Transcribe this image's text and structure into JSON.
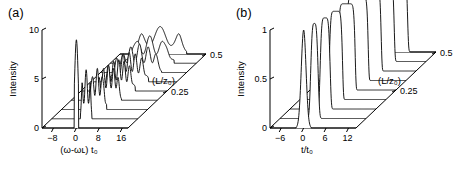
{
  "figure": {
    "background": "#ffffff",
    "line_color": "#000000",
    "panels": [
      {
        "id": "a",
        "label": "(a)",
        "y_axis_label": "Intensity",
        "y_ticks": [
          "0",
          "5",
          "10"
        ],
        "x_axis_label": "(ω-ωʟ) t₀",
        "x_ticks": [
          "−8",
          "0",
          "8",
          "16"
        ],
        "z_axis_label": "(L/z₀)",
        "z_ticks": [
          "0.25",
          "0.5"
        ]
      },
      {
        "id": "b",
        "label": "(b)",
        "y_axis_label": "Intensity",
        "y_ticks": [
          "0",
          "0.5",
          "1"
        ],
        "x_axis_label": "t/t₀",
        "x_ticks": [
          "−6",
          "0",
          "6",
          "12"
        ],
        "z_axis_label": "(L/z₀)",
        "z_ticks": [
          "0.25",
          "0.5"
        ]
      }
    ]
  },
  "chart_data": [
    {
      "type": "line",
      "title": "(a)",
      "plot_style": "waterfall-3d",
      "xlabel": "(ω-ωʟ) t₀",
      "ylabel": "Intensity",
      "zlabel": "(L/z₀)",
      "xlim": [
        -12,
        18
      ],
      "ylim": [
        0,
        10
      ],
      "zlim": [
        0,
        0.5
      ],
      "xticks": [
        -8,
        0,
        8,
        16
      ],
      "yticks": [
        0,
        5,
        10
      ],
      "zticks": [
        0.25,
        0.5
      ],
      "grid": false,
      "legend": "none",
      "n_traces": 9,
      "trace_z_values": [
        0.0,
        0.0625,
        0.125,
        0.1875,
        0.25,
        0.3125,
        0.375,
        0.4375,
        0.5
      ],
      "description": "Spectral evolution showing self-phase-modulation broadening: a single tall narrow spectral spike at L/z0=0 develops oscillatory multi-peak structure and broadens into a wide double-humped spectrum at L/z0=0.5",
      "series": [
        {
          "name": "L/z0 = 0",
          "peak_x": 0,
          "peak_y": 9.0,
          "n_peaks": 1,
          "halfwidth": 0.6
        },
        {
          "name": "L/z0 = 0.0625",
          "peak_x": 0,
          "peak_y": 5.0,
          "n_peaks": 2,
          "halfwidth": 1.6
        },
        {
          "name": "L/z0 = 0.125",
          "peak_x": 0.5,
          "peak_y": 4.2,
          "n_peaks": 3,
          "halfwidth": 2.6
        },
        {
          "name": "L/z0 = 0.1875",
          "peak_x": 1.0,
          "peak_y": 3.6,
          "n_peaks": 4,
          "halfwidth": 3.6
        },
        {
          "name": "L/z0 = 0.25",
          "peak_x": 1.2,
          "peak_y": 3.2,
          "n_peaks": 5,
          "halfwidth": 4.6
        },
        {
          "name": "L/z0 = 0.3125",
          "peak_x": 1.4,
          "peak_y": 3.0,
          "n_peaks": 5,
          "halfwidth": 5.4
        },
        {
          "name": "L/z0 = 0.375",
          "peak_x": 1.6,
          "peak_y": 2.9,
          "n_peaks": 4,
          "halfwidth": 6.2
        },
        {
          "name": "L/z0 = 0.4375",
          "peak_x": 1.8,
          "peak_y": 2.8,
          "n_peaks": 3,
          "halfwidth": 6.8
        },
        {
          "name": "L/z0 = 0.5",
          "peak_x": 2.0,
          "peak_y": 2.8,
          "n_peaks": 2,
          "halfwidth": 7.4
        }
      ]
    },
    {
      "type": "line",
      "title": "(b)",
      "plot_style": "waterfall-3d",
      "xlabel": "t/t₀",
      "ylabel": "Intensity",
      "zlabel": "(L/z₀)",
      "xlim": [
        -9,
        14
      ],
      "ylim": [
        0,
        1
      ],
      "zlim": [
        0,
        0.5
      ],
      "xticks": [
        -6,
        0,
        6,
        12
      ],
      "yticks": [
        0,
        0.5,
        1
      ],
      "zticks": [
        0.25,
        0.5
      ],
      "grid": false,
      "legend": "none",
      "n_traces": 9,
      "trace_z_values": [
        0.0,
        0.0625,
        0.125,
        0.1875,
        0.25,
        0.3125,
        0.375,
        0.4375,
        0.5
      ],
      "description": "Temporal evolution: an initially narrow intense pulse broadens and reshapes into a flat-topped (rectangular) pulse with steep edges as L/z0 increases to 0.5",
      "series": [
        {
          "name": "L/z0 = 0",
          "peak_t": 0,
          "peak_y": 1.0,
          "width": 0.9,
          "flatness": 0.0
        },
        {
          "name": "L/z0 = 0.0625",
          "peak_t": 0.2,
          "peak_y": 0.97,
          "width": 1.1,
          "flatness": 0.1
        },
        {
          "name": "L/z0 = 0.125",
          "peak_t": 0.4,
          "peak_y": 0.93,
          "width": 1.4,
          "flatness": 0.2
        },
        {
          "name": "L/z0 = 0.1875",
          "peak_t": 0.6,
          "peak_y": 0.9,
          "width": 1.8,
          "flatness": 0.35
        },
        {
          "name": "L/z0 = 0.25",
          "peak_t": 0.8,
          "peak_y": 0.88,
          "width": 2.3,
          "flatness": 0.5
        },
        {
          "name": "L/z0 = 0.3125",
          "peak_t": 1.0,
          "peak_y": 0.87,
          "width": 2.9,
          "flatness": 0.65
        },
        {
          "name": "L/z0 = 0.375",
          "peak_t": 1.2,
          "peak_y": 0.86,
          "width": 3.5,
          "flatness": 0.8
        },
        {
          "name": "L/z0 = 0.4375",
          "peak_t": 1.4,
          "peak_y": 0.86,
          "width": 4.1,
          "flatness": 0.9
        },
        {
          "name": "L/z0 = 0.5",
          "peak_t": 1.6,
          "peak_y": 0.86,
          "width": 4.8,
          "flatness": 1.0
        }
      ]
    }
  ]
}
